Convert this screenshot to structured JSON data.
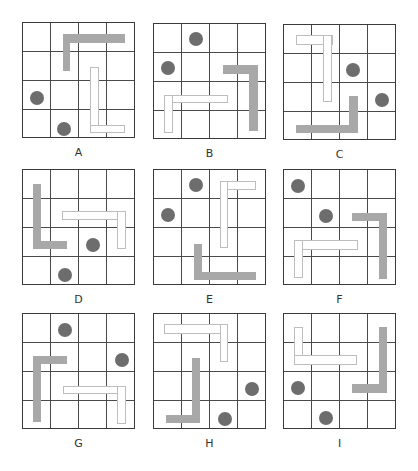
{
  "colors": {
    "grid_line": "#4a4a4a",
    "grid_border": "#3a3a3a",
    "dark_piece": "#a8a8a8",
    "light_piece_border": "#bdbdbd",
    "dot": "#6d6d6d"
  },
  "grid_size": 4,
  "panels": [
    {
      "label": "A",
      "x": 22,
      "y": 22,
      "dots": [
        [
          0.48,
          2.6
        ],
        [
          1.46,
          3.64
        ]
      ],
      "dark": [
        [
          1.4,
          0.39,
          3.61,
          0.69
        ],
        [
          1.4,
          0.39,
          1.68,
          1.64
        ]
      ],
      "light": [
        [
          2.38,
          1.5,
          2.68,
          3.79
        ],
        [
          2.38,
          3.52,
          3.61,
          3.79
        ]
      ]
    },
    {
      "label": "B",
      "x": 153,
      "y": 23,
      "dots": [
        [
          1.49,
          0.51
        ],
        [
          0.49,
          1.51
        ]
      ],
      "dark": [
        [
          2.44,
          1.43,
          3.67,
          1.73
        ],
        [
          3.37,
          1.43,
          3.67,
          3.69
        ]
      ],
      "light": [
        [
          0.37,
          2.44,
          2.63,
          2.74
        ],
        [
          0.37,
          2.44,
          0.67,
          3.75
        ]
      ]
    },
    {
      "label": "C",
      "x": 283,
      "y": 24,
      "dots": [
        [
          2.46,
          1.55
        ],
        [
          3.46,
          2.58
        ]
      ],
      "dark": [
        [
          2.3,
          2.46,
          2.62,
          3.74
        ],
        [
          0.42,
          3.45,
          2.62,
          3.74
        ]
      ],
      "light": [
        [
          0.42,
          0.36,
          1.73,
          0.68
        ],
        [
          1.37,
          0.36,
          1.7,
          2.67
        ]
      ]
    },
    {
      "label": "D",
      "x": 22,
      "y": 169,
      "dots": [
        [
          2.48,
          2.6
        ],
        [
          1.49,
          3.63
        ]
      ],
      "dark": [
        [
          0.36,
          0.48,
          0.65,
          2.74
        ],
        [
          0.36,
          2.46,
          1.57,
          2.74
        ]
      ],
      "light": [
        [
          1.37,
          1.43,
          3.63,
          1.73
        ],
        [
          3.31,
          1.43,
          3.63,
          2.74
        ]
      ]
    },
    {
      "label": "E",
      "x": 153,
      "y": 169,
      "dots": [
        [
          1.49,
          0.51
        ],
        [
          0.49,
          1.56
        ]
      ],
      "dark": [
        [
          1.4,
          2.54,
          1.7,
          3.79
        ],
        [
          1.4,
          3.51,
          3.61,
          3.79
        ]
      ],
      "light": [
        [
          2.32,
          0.39,
          3.61,
          0.69
        ],
        [
          2.32,
          0.39,
          2.63,
          2.68
        ]
      ]
    },
    {
      "label": "F",
      "x": 283,
      "y": 169,
      "dots": [
        [
          0.51,
          0.56
        ],
        [
          1.49,
          1.57
        ]
      ],
      "dark": [
        [
          2.42,
          1.48,
          3.65,
          1.77
        ],
        [
          3.35,
          1.48,
          3.65,
          3.77
        ]
      ],
      "light": [
        [
          0.36,
          2.43,
          2.62,
          2.76
        ],
        [
          0.36,
          2.43,
          0.69,
          3.74
        ]
      ]
    },
    {
      "label": "G",
      "x": 22,
      "y": 313,
      "dots": [
        [
          1.49,
          0.55
        ],
        [
          3.49,
          1.58
        ]
      ],
      "dark": [
        [
          0.36,
          1.46,
          1.57,
          1.74
        ],
        [
          0.36,
          1.46,
          0.65,
          3.73
        ]
      ],
      "light": [
        [
          1.4,
          2.48,
          3.63,
          2.77
        ],
        [
          3.31,
          2.48,
          3.63,
          3.79
        ]
      ]
    },
    {
      "label": "H",
      "x": 153,
      "y": 313,
      "dots": [
        [
          3.46,
          2.6
        ],
        [
          2.51,
          3.61
        ]
      ],
      "dark": [
        [
          1.35,
          1.51,
          1.64,
          3.77
        ],
        [
          0.42,
          3.49,
          1.64,
          3.77
        ]
      ],
      "light": [
        [
          0.37,
          0.36,
          2.63,
          0.68
        ],
        [
          2.32,
          0.36,
          2.63,
          1.67
        ]
      ]
    },
    {
      "label": "I",
      "x": 283,
      "y": 313,
      "dots": [
        [
          0.49,
          2.56
        ],
        [
          1.49,
          3.6
        ]
      ],
      "dark": [
        [
          3.37,
          0.44,
          3.65,
          2.74
        ],
        [
          2.42,
          2.43,
          3.65,
          2.74
        ]
      ],
      "light": [
        [
          0.36,
          0.44,
          0.68,
          1.75
        ],
        [
          0.36,
          1.43,
          2.58,
          1.75
        ]
      ]
    }
  ]
}
